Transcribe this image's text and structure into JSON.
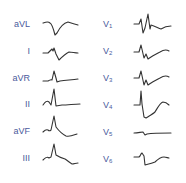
{
  "diagram": {
    "type": "ecg-12-lead-waveforms",
    "colors": {
      "label": "#4a5a9c",
      "trace": "#333333",
      "background": "#ffffff"
    },
    "limb_leads": [
      {
        "lead": "aVL",
        "label": "aVL",
        "base": "aVL",
        "sub": ""
      },
      {
        "lead": "I",
        "label": "I",
        "base": "I",
        "sub": ""
      },
      {
        "lead": "aVR",
        "label": "aVR",
        "base": "aVR",
        "sub": ""
      },
      {
        "lead": "II",
        "label": "II",
        "base": "II",
        "sub": ""
      },
      {
        "lead": "aVF",
        "label": "aVF",
        "base": "aVF",
        "sub": ""
      },
      {
        "lead": "III",
        "label": "III",
        "base": "III",
        "sub": ""
      }
    ],
    "precordial_leads": [
      {
        "lead": "V1",
        "label": "V1",
        "base": "V",
        "sub": "1"
      },
      {
        "lead": "V2",
        "label": "V2",
        "base": "V",
        "sub": "2"
      },
      {
        "lead": "V3",
        "label": "V3",
        "base": "V",
        "sub": "3"
      },
      {
        "lead": "V4",
        "label": "V4",
        "base": "V",
        "sub": "4"
      },
      {
        "lead": "V5",
        "label": "V5",
        "base": "V",
        "sub": "5"
      },
      {
        "lead": "V6",
        "label": "V6",
        "base": "V",
        "sub": "6"
      }
    ]
  }
}
